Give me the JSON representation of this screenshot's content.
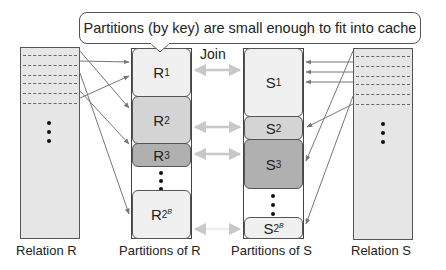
{
  "callout": {
    "text": "Partitions (by key) are small enough to fit into cache"
  },
  "join_label": "Join",
  "relation_r": {
    "label": "Relation R",
    "fill": "#e6e6e6"
  },
  "relation_s": {
    "label": "Relation S",
    "fill": "#e6e6e6"
  },
  "partitions_r": {
    "label": "Partitions of R",
    "items": [
      {
        "name": "R",
        "sub": "1",
        "fill": "#f0f0f0"
      },
      {
        "name": "R",
        "sub": "2",
        "fill": "#d4d4d4"
      },
      {
        "name": "R",
        "sub": "3",
        "fill": "#b0b0b0"
      },
      {
        "name": "R",
        "sub": "2",
        "sup": "B",
        "fill": "#f0f0f0"
      }
    ]
  },
  "partitions_s": {
    "label": "Partitions of S",
    "items": [
      {
        "name": "S",
        "sub": "1",
        "fill": "#f0f0f0"
      },
      {
        "name": "S",
        "sub": "2",
        "fill": "#d4d4d4"
      },
      {
        "name": "S",
        "sub": "3",
        "fill": "#b0b0b0"
      },
      {
        "name": "S",
        "sub": "2",
        "sup": "B",
        "fill": "#f0f0f0"
      }
    ]
  },
  "colors": {
    "arrow": "#777777",
    "join_arrow": "#c8c8c8",
    "border": "#555555"
  }
}
